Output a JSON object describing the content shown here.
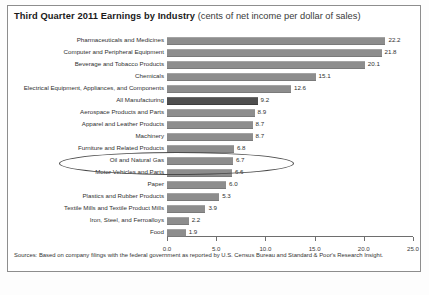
{
  "title": {
    "main": "Third Quarter 2011 Earnings by Industry",
    "subtitle": "(cents of net income per dollar of sales)"
  },
  "source": "Sources: Based on company filings with the federal government as reported by U.S. Census Bureau and Standard & Poor's Research Insight.",
  "caption": "",
  "annotation": {
    "shape": "ellipse",
    "target": "Oil and Natural Gas"
  },
  "colors": {
    "bar": "#8d8d8d",
    "bar_highlight": "#4f4f4f",
    "axis": "#6e6e6e",
    "border": "#8d8d8d",
    "text": "#2f2f2f"
  },
  "chart_data": {
    "type": "bar",
    "orientation": "horizontal",
    "title": "Third Quarter 2011 Earnings by Industry (cents of net income per dollar of sales)",
    "xlabel": "",
    "ylabel": "",
    "xlim": [
      0.0,
      25.0
    ],
    "xticks": [
      "0.0",
      "5.0",
      "10.0",
      "15.0",
      "20.0",
      "25.0"
    ],
    "grid": false,
    "legend": false,
    "highlight_category": "All Manufacturing",
    "categories": [
      "Pharmaceuticals and Medicines",
      "Computer and Peripheral Equipment",
      "Beverage and Tobacco Products",
      "Chemicals",
      "Electrical Equipment, Appliances, and Components",
      "All Manufacturing",
      "Aerospace Products and Parts",
      "Apparel and Leather Products",
      "Machinery",
      "Furniture and Related Products",
      "Oil and Natural Gas",
      "Motor Vehicles and Parts",
      "Paper",
      "Plastics and Rubber Products",
      "Textile Mills and Textile Product Mills",
      "Iron, Steel, and Ferroalloys",
      "Food"
    ],
    "values": [
      22.2,
      21.8,
      20.1,
      15.1,
      12.6,
      9.2,
      8.9,
      8.7,
      8.7,
      6.8,
      6.7,
      6.6,
      6.0,
      5.3,
      3.9,
      2.2,
      1.9
    ],
    "value_labels": [
      "22.2",
      "21.8",
      "20.1",
      "15.1",
      "12.6",
      "9.2",
      "8.9",
      "8.7",
      "8.7",
      "6.8",
      "6.7",
      "6.6",
      "6.0",
      "5.3",
      "3.9",
      "2.2",
      "1.9"
    ]
  }
}
